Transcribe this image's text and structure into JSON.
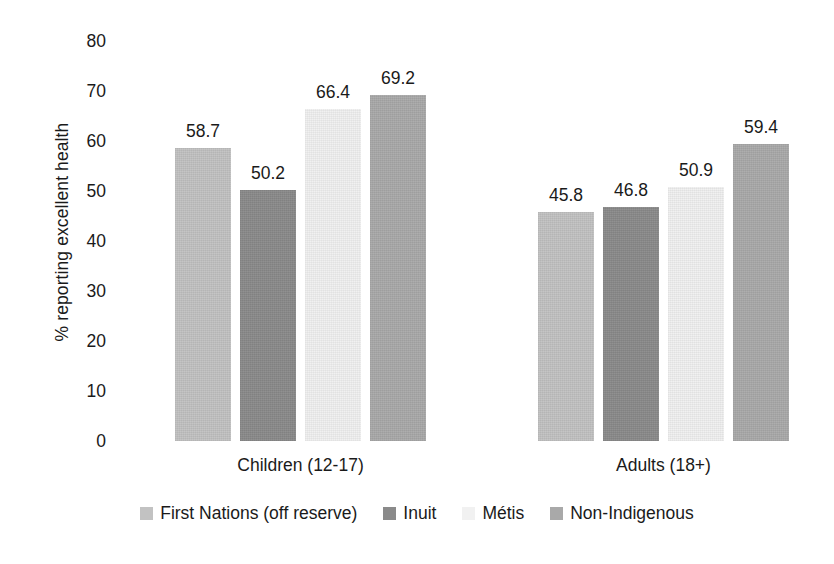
{
  "chart_data": {
    "type": "bar",
    "title": "",
    "subtitle": "",
    "xlabel": "",
    "ylabel": "% reporting excellent health",
    "ylim": [
      0,
      80
    ],
    "ytick_step": 10,
    "yticks": [
      "80",
      "70",
      "60",
      "50",
      "40",
      "30",
      "20",
      "10",
      "0"
    ],
    "ytick_values": [
      80,
      70,
      60,
      50,
      40,
      30,
      20,
      10,
      0
    ],
    "grid": false,
    "legend_position": "bottom",
    "categories": [
      "Children (12-17)",
      "Adults (18+)"
    ],
    "series": [
      {
        "name": "First Nations (off reserve)",
        "color": "#c2c2c2",
        "values": [
          58.7,
          45.8
        ],
        "labels": [
          "58.7",
          "45.8"
        ]
      },
      {
        "name": "Inuit",
        "color": "#8a8a8a",
        "values": [
          50.2,
          46.8
        ],
        "labels": [
          "50.2",
          "46.8"
        ]
      },
      {
        "name": "Métis",
        "color": "#f1f1f1",
        "values": [
          66.4,
          50.9
        ],
        "labels": [
          "66.4",
          "50.9"
        ]
      },
      {
        "name": "Non-Indigenous",
        "color": "#a9a9a9",
        "values": [
          69.2,
          59.4
        ],
        "labels": [
          "69.2",
          "59.4"
        ]
      }
    ]
  },
  "axis": {
    "y_title": "% reporting excellent health"
  },
  "legend": {
    "items": [
      {
        "label": "First Nations (off reserve)",
        "color": "#c2c2c2"
      },
      {
        "label": "Inuit",
        "color": "#8a8a8a"
      },
      {
        "label": "Métis",
        "color": "#f1f1f1"
      },
      {
        "label": "Non-Indigenous",
        "color": "#a9a9a9"
      }
    ]
  }
}
